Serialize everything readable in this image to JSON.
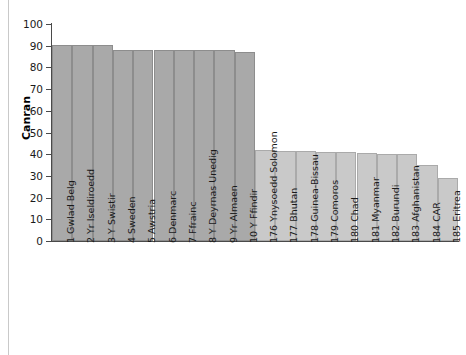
{
  "chart_data": {
    "type": "bar",
    "title": "",
    "xlabel": "",
    "ylabel": "Canran",
    "ylim": [
      0,
      100
    ],
    "ytick_values": [
      0,
      10,
      20,
      30,
      40,
      50,
      60,
      70,
      80,
      90,
      100
    ],
    "ytick_labels": [
      "0",
      "10",
      "20",
      "30",
      "40",
      "50",
      "60",
      "70",
      "80",
      "90",
      "100"
    ],
    "grid": false,
    "legend": "none",
    "categories": [
      "1 Gwlad Belg",
      "2 Yr Iseldiroedd",
      "3 Y Swistir",
      "4 Sweden",
      "5 Awstria",
      "6 Denmarc",
      "7 Ffrainc",
      "8 Y Deyrnas Unedig",
      "9 Yr Almaen",
      "10 Y Ffindir",
      "176 Ynysoedd Solomon",
      "177 Bhutan",
      "178 Guinea-Bissau",
      "179 Comoros",
      "180 Chad",
      "181 Myanmar",
      "182 Burundi",
      "183 Afghanistan",
      "184 CAR",
      "185 Eritrea"
    ],
    "values": [
      90.5,
      90.5,
      90.5,
      88,
      88,
      88,
      88,
      88,
      88,
      87,
      42,
      41.5,
      41.5,
      41,
      41,
      40.5,
      40,
      40,
      35,
      29
    ],
    "group_of_bar": [
      1,
      1,
      1,
      1,
      1,
      1,
      1,
      1,
      1,
      1,
      2,
      2,
      2,
      2,
      2,
      2,
      2,
      2,
      2,
      2
    ],
    "colors": {
      "group1": "#a9a9a9",
      "group2": "#c9c9c9",
      "axis": "#4a4a4a",
      "text": "#1a1a1a",
      "background": "#ffffff"
    }
  }
}
